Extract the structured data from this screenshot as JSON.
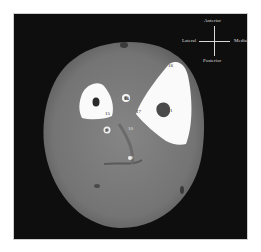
{
  "figure": {
    "background_color": "#0e0e0e",
    "tissue_color": "#7a7a7a",
    "bone_color": "#fafafa"
  },
  "compass": {
    "anterior": "Anterior",
    "posterior": "Posterior",
    "lateral": "Lateral",
    "medial": "Medial"
  },
  "labels": [
    {
      "id": "16",
      "text": "16"
    },
    {
      "id": "14",
      "text": "14"
    },
    {
      "id": "15",
      "text": "15"
    },
    {
      "id": "17",
      "text": "17"
    },
    {
      "id": "1",
      "text": "1"
    },
    {
      "id": "10",
      "text": "10"
    },
    {
      "id": "2",
      "text": "2"
    },
    {
      "id": "18",
      "text": "18"
    }
  ]
}
